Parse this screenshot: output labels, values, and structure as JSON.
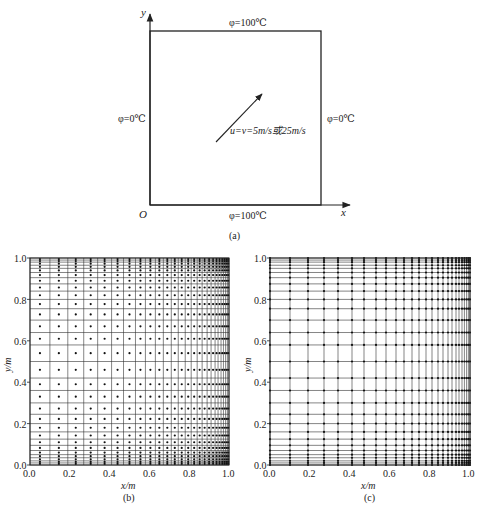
{
  "panel_a": {
    "caption": "(a)",
    "axis_x_label": "x",
    "axis_y_label": "y",
    "origin_label": "O",
    "boundary_top": "φ=100℃",
    "boundary_bottom": "φ=100℃",
    "boundary_left": "φ=0℃",
    "boundary_right": "φ=0℃",
    "velocity_label": "u=v=5m/s或25m/s"
  },
  "panel_b": {
    "caption": "(b)",
    "xlabel": "x/m",
    "ylabel": "y/m",
    "xticks": [
      "0.0",
      "0.2",
      "0.4",
      "0.6",
      "0.8",
      "1.0"
    ],
    "yticks": [
      "0.0",
      "0.2",
      "0.4",
      "0.6",
      "0.8",
      "1.0"
    ]
  },
  "panel_c": {
    "caption": "(c)",
    "xlabel": "x/m",
    "ylabel": "y/m",
    "xticks": [
      "0.0",
      "0.2",
      "0.4",
      "0.6",
      "0.8",
      "1.0"
    ],
    "yticks": [
      "0.0",
      "0.2",
      "0.4",
      "0.6",
      "0.8",
      "1.0"
    ]
  },
  "chart_data": [
    {
      "type": "diagram",
      "title": "(a) Square domain with boundary conditions",
      "domain": {
        "x": [
          0,
          1
        ],
        "y": [
          0,
          1
        ]
      },
      "boundaries": {
        "top": "φ=100℃",
        "bottom": "φ=100℃",
        "left": "φ=0℃",
        "right": "φ=0℃"
      },
      "velocity": "u=v=5m/s或25m/s"
    },
    {
      "type": "scatter",
      "title": "(b) Non-uniform grid, cell-centred nodes (clustered toward x=1, y=0, y=1)",
      "xlabel": "x/m",
      "ylabel": "y/m",
      "xlim": [
        0,
        1
      ],
      "ylim": [
        0,
        1
      ],
      "x_lines": [
        0.0,
        0.1,
        0.19,
        0.27,
        0.34,
        0.41,
        0.47,
        0.53,
        0.58,
        0.63,
        0.67,
        0.71,
        0.745,
        0.78,
        0.81,
        0.84,
        0.865,
        0.89,
        0.91,
        0.93,
        0.945,
        0.96,
        0.972,
        0.983,
        0.992,
        1.0
      ],
      "y_lines": [
        0.0,
        0.01,
        0.02,
        0.035,
        0.05,
        0.07,
        0.095,
        0.125,
        0.16,
        0.2,
        0.245,
        0.3,
        0.36,
        0.42,
        0.5,
        0.58,
        0.64,
        0.7,
        0.755,
        0.8,
        0.84,
        0.875,
        0.905,
        0.93,
        0.95,
        0.965,
        0.98,
        0.99,
        1.0
      ],
      "grid": true
    },
    {
      "type": "scatter",
      "title": "(c) Non-uniform grid, nodes at line intersections",
      "xlabel": "x/m",
      "ylabel": "y/m",
      "xlim": [
        0,
        1
      ],
      "ylim": [
        0,
        1
      ],
      "x_lines": [
        0.0,
        0.1,
        0.19,
        0.27,
        0.34,
        0.41,
        0.47,
        0.53,
        0.58,
        0.63,
        0.67,
        0.71,
        0.745,
        0.78,
        0.81,
        0.84,
        0.865,
        0.89,
        0.91,
        0.93,
        0.945,
        0.96,
        0.972,
        0.983,
        0.992,
        1.0
      ],
      "y_lines": [
        0.0,
        0.01,
        0.02,
        0.035,
        0.05,
        0.07,
        0.095,
        0.125,
        0.16,
        0.2,
        0.245,
        0.3,
        0.36,
        0.42,
        0.5,
        0.58,
        0.64,
        0.7,
        0.755,
        0.8,
        0.84,
        0.875,
        0.905,
        0.93,
        0.95,
        0.965,
        0.98,
        0.99,
        1.0
      ],
      "grid": true
    }
  ]
}
